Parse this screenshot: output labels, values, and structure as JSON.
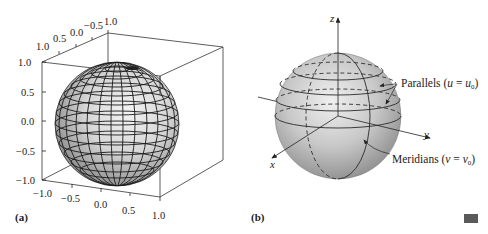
{
  "figure": {
    "panel_a": {
      "label": "(a)",
      "top_ticks": [
        "1.0",
        "0.5",
        "0.0",
        "−0.5",
        "1.0"
      ],
      "left_ticks": [
        "1.0",
        "0.5",
        "0.0",
        "−0.5",
        "−1.0"
      ],
      "bottom_ticks": [
        "−1.0",
        "−0.5",
        "0.0",
        "0.5",
        "1.0"
      ],
      "description": "Wireframe shaded unit sphere inside bounding box"
    },
    "panel_b": {
      "label": "(b)",
      "axes": {
        "x": "x",
        "y": "y",
        "z": "z"
      },
      "annotation_parallels": "Parallels (u = u₀)",
      "annotation_parallels_parts": {
        "text": "Parallels (",
        "var": "u",
        "eq": " = ",
        "var0": "u",
        "sub": "0",
        "close": ")"
      },
      "annotation_meridians_parts": {
        "text": "Meridians (",
        "var": "v",
        "eq": " = ",
        "var0": "v",
        "sub": "0",
        "close": ")"
      }
    },
    "end_marker_color": "#5a5a5a"
  }
}
